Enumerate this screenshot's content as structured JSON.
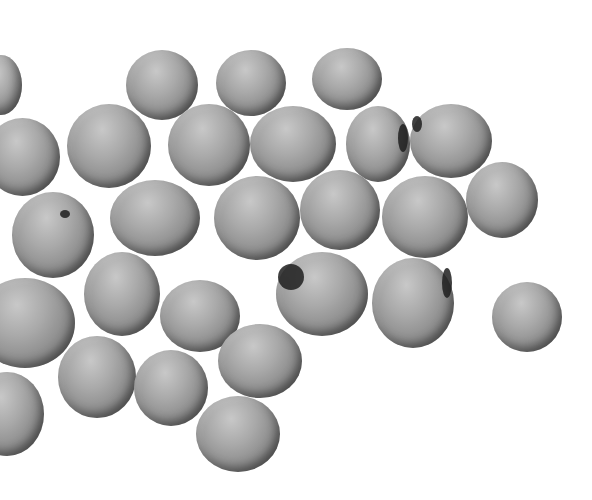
{
  "image": {
    "description": "Grayscale photograph of soybeans scattered on a white background",
    "subject": "soybeans",
    "background_color": "#ffffff",
    "bean_count_visible": 27,
    "beans": [
      {
        "x": -20,
        "y": 55,
        "w": 42,
        "h": 60
      },
      {
        "x": -15,
        "y": 118,
        "w": 75,
        "h": 78
      },
      {
        "x": 126,
        "y": 50,
        "w": 72,
        "h": 70
      },
      {
        "x": 216,
        "y": 50,
        "w": 70,
        "h": 66
      },
      {
        "x": 312,
        "y": 48,
        "w": 70,
        "h": 62
      },
      {
        "x": 67,
        "y": 104,
        "w": 84,
        "h": 84
      },
      {
        "x": 168,
        "y": 104,
        "w": 82,
        "h": 82
      },
      {
        "x": 250,
        "y": 106,
        "w": 86,
        "h": 76
      },
      {
        "x": 346,
        "y": 106,
        "w": 64,
        "h": 76,
        "hilum": {
          "x": 52,
          "y": 18,
          "w": 10,
          "h": 28
        }
      },
      {
        "x": 410,
        "y": 104,
        "w": 82,
        "h": 74,
        "hilum": {
          "x": 2,
          "y": 12,
          "w": 10,
          "h": 16
        }
      },
      {
        "x": 12,
        "y": 192,
        "w": 82,
        "h": 86,
        "hilum": {
          "x": 48,
          "y": 18,
          "w": 10,
          "h": 8
        }
      },
      {
        "x": 110,
        "y": 180,
        "w": 90,
        "h": 76
      },
      {
        "x": 214,
        "y": 176,
        "w": 86,
        "h": 84
      },
      {
        "x": 300,
        "y": 170,
        "w": 80,
        "h": 80
      },
      {
        "x": 382,
        "y": 176,
        "w": 86,
        "h": 82
      },
      {
        "x": 466,
        "y": 162,
        "w": 72,
        "h": 76
      },
      {
        "x": -25,
        "y": 278,
        "w": 100,
        "h": 90
      },
      {
        "x": 84,
        "y": 252,
        "w": 76,
        "h": 84
      },
      {
        "x": 160,
        "y": 280,
        "w": 80,
        "h": 72
      },
      {
        "x": 276,
        "y": 252,
        "w": 92,
        "h": 84,
        "hilum": {
          "x": 2,
          "y": 12,
          "w": 26,
          "h": 26
        }
      },
      {
        "x": 372,
        "y": 258,
        "w": 82,
        "h": 90,
        "hilum": {
          "x": 70,
          "y": 10,
          "w": 10,
          "h": 30
        }
      },
      {
        "x": 492,
        "y": 282,
        "w": 70,
        "h": 70
      },
      {
        "x": 58,
        "y": 336,
        "w": 78,
        "h": 82
      },
      {
        "x": 134,
        "y": 350,
        "w": 74,
        "h": 76
      },
      {
        "x": 218,
        "y": 324,
        "w": 84,
        "h": 74
      },
      {
        "x": -30,
        "y": 372,
        "w": 74,
        "h": 84
      },
      {
        "x": 196,
        "y": 396,
        "w": 84,
        "h": 76
      }
    ]
  }
}
